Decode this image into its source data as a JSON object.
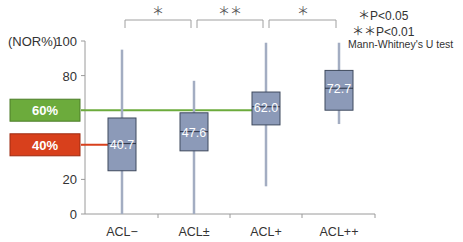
{
  "chart_data": {
    "type": "box",
    "title": "",
    "xlabel": "",
    "ylabel": "(NOR%)",
    "ylim": [
      0,
      100
    ],
    "yticks": [
      0,
      20,
      40,
      60,
      80,
      100
    ],
    "categories": [
      "ACL−",
      "ACL±",
      "ACL+",
      "ACL++"
    ],
    "boxes": [
      {
        "category": "ACL−",
        "whisker_low": 0,
        "q1": 25,
        "median": 40.7,
        "q3": 55.5,
        "whisker_high": 95,
        "median_label": "40.7"
      },
      {
        "category": "ACL±",
        "whisker_low": 0,
        "q1": 36.5,
        "median": 47.6,
        "q3": 58.5,
        "whisker_high": 77,
        "median_label": "47.6"
      },
      {
        "category": "ACL+",
        "whisker_low": 16,
        "q1": 51.5,
        "median": 62.0,
        "q3": 70.5,
        "whisker_high": 99,
        "median_label": "62.0"
      },
      {
        "category": "ACL++",
        "whisker_low": 52,
        "q1": 60,
        "median": 72.7,
        "q3": 83,
        "whisker_high": 99,
        "median_label": "72.7"
      }
    ],
    "reference_lines": [
      {
        "value": 60,
        "label": "60%",
        "color": "#6cab3c",
        "extends_to": "ACL+"
      },
      {
        "value": 40,
        "label": "40%",
        "color": "#d8401c",
        "extends_to": "ACL−"
      }
    ],
    "significance": [
      {
        "from": "ACL−",
        "to": "ACL±",
        "label": "＊"
      },
      {
        "from": "ACL±",
        "to": "ACL+",
        "label": "＊＊"
      },
      {
        "from": "ACL+",
        "to": "ACL++",
        "label": "＊"
      }
    ],
    "legend": [
      "＊P<0.05",
      "＊＊P<0.01",
      "Mann-Whitney's U test"
    ],
    "grid": false
  },
  "colors": {
    "box_fill": "#8c9ab8",
    "box_stroke": "#3f4a5e",
    "whisker": "#a3adc2",
    "axis": "#9a9a9a",
    "ref_green": "#6cab3c",
    "ref_red": "#d8401c"
  }
}
